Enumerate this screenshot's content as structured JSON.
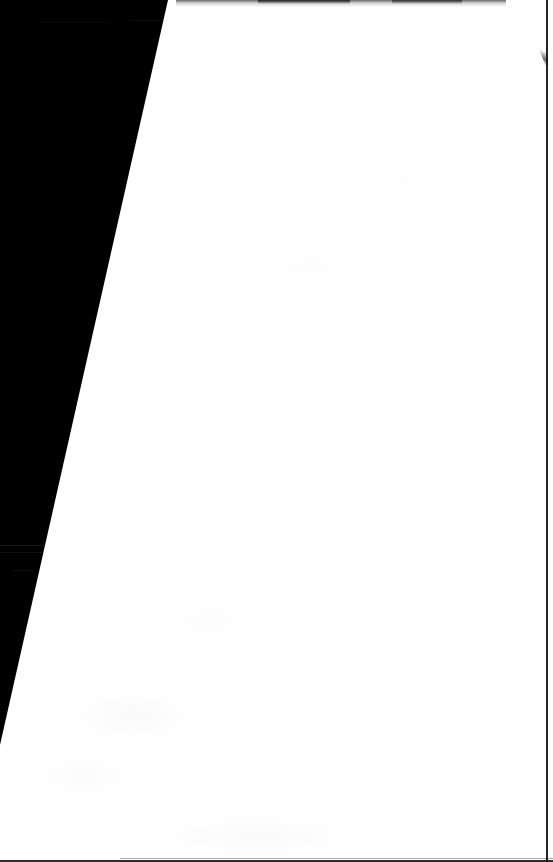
{
  "document": {
    "kind": "scanned-page",
    "title": "Blank page scan",
    "page_content": "",
    "body_text": "",
    "visible_text_count": 0,
    "note": "No text, figures, or printed marks are legible on the page."
  },
  "canvas": {
    "width": 553,
    "height": 862,
    "background_color": "#000000"
  },
  "paper": {
    "label": "White paper sheet",
    "fill_color": "#ffffff",
    "orientation": "portrait",
    "tilt_description": "left edge slants from upper-right to lower-left",
    "corners": {
      "top_left_x": 168,
      "top_right_x": 553,
      "bottom_left_y": 745,
      "bottom_right_y": 862
    }
  },
  "backdrop": {
    "label": "Dark background wedge",
    "fill_color": "#000000",
    "region": "left side, tapering from full height at top to a point near y=745"
  },
  "marks": {
    "top_edge_smudge": "faint dark band along the top trimmed edge",
    "corner_fold": "thin grey diagonal sliver at the top-right corner",
    "frame_right_rule": "thin dark vertical rule near the right margin",
    "frame_bottom_rule": "thin dark horizontal rule along the bottom margin",
    "backdrop_streaks": "a few faint grey streaks inside the dark area"
  }
}
